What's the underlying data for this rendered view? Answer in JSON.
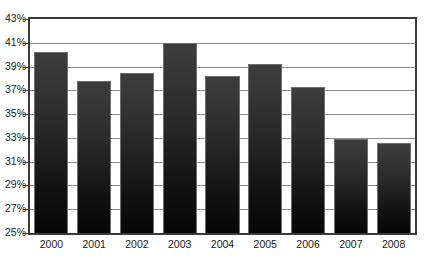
{
  "chart_data": {
    "type": "bar",
    "title": "",
    "xlabel": "",
    "ylabel": "",
    "categories": [
      "2000",
      "2001",
      "2002",
      "2003",
      "2004",
      "2005",
      "2006",
      "2007",
      "2008"
    ],
    "values": [
      40.2,
      37.8,
      38.5,
      41.0,
      38.2,
      39.2,
      37.3,
      32.9,
      32.6
    ],
    "value_labels": [
      "40.2%",
      "37.8%",
      "38.5%",
      "41.0%",
      "38.2%",
      "39.2%",
      "37.3%",
      "32.9%",
      "32.6%"
    ],
    "ylim": [
      25,
      43
    ],
    "ytick_values": [
      25,
      27,
      29,
      31,
      33,
      35,
      37,
      39,
      41,
      43
    ],
    "ytick_labels": [
      "25%",
      "27%",
      "29%",
      "31%",
      "33%",
      "35%",
      "37%",
      "39%",
      "41%",
      "43%"
    ],
    "grid": true,
    "grid_axis": "y",
    "legend": false,
    "legend_position": "none",
    "series": [
      {
        "name": "",
        "values": [
          40.2,
          37.8,
          38.5,
          41.0,
          38.2,
          39.2,
          37.3,
          32.9,
          32.6
        ]
      }
    ],
    "colors": {
      "bar_top": "#3d3d3d",
      "bar_bottom": "#050505",
      "bar_border": "#6f6f6f",
      "gridline": "#8a8a8a",
      "axis_frame": "#3b3b3b",
      "tick_label": "#1a1a1a",
      "background": "#ffffff"
    }
  }
}
